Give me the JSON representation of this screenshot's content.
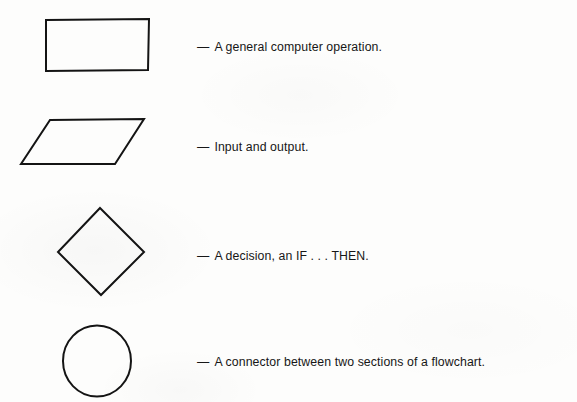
{
  "page": {
    "background_color": "#fdfdfc",
    "ink_color": "#141414"
  },
  "legend": {
    "dash": "—",
    "entries": [
      {
        "shape": "rectangle",
        "shape_label": "rectangle-symbol",
        "description": "A general computer operation."
      },
      {
        "shape": "parallelogram",
        "shape_label": "parallelogram-symbol",
        "description": "Input and output."
      },
      {
        "shape": "diamond",
        "shape_label": "diamond-symbol",
        "description": "A decision, an IF . . . THEN."
      },
      {
        "shape": "circle",
        "shape_label": "circle-symbol",
        "description": "A connector between two sections of a flowchart."
      }
    ]
  }
}
